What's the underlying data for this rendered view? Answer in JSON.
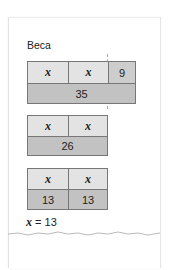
{
  "student_name": "Beca",
  "bar_model_1": {
    "top_row": [
      "x",
      "x",
      "9"
    ],
    "bottom_row_total": "35"
  },
  "bar_model_2": {
    "top_row": [
      "x",
      "x"
    ],
    "bottom_row_total": "26"
  },
  "bar_model_3": {
    "top_row": [
      "x",
      "x"
    ],
    "bottom_row": [
      "13",
      "13"
    ]
  },
  "answer": {
    "variable": "x",
    "equals": "=",
    "value": "13"
  },
  "colors": {
    "light_cell": "#e3e3e3",
    "dark_cell": "#c2c2c2",
    "border": "#777777"
  }
}
